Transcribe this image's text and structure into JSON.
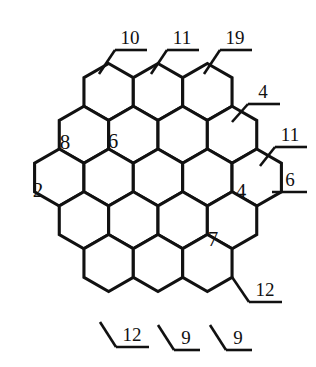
{
  "figure": {
    "type": "patent-line-drawing",
    "background_color": "#ffffff",
    "line_color": "#111111",
    "cell_rows": [
      3,
      4,
      5,
      4,
      3
    ],
    "cell_count_total": 19,
    "cell_shape": "hexagon-pointy-top"
  },
  "interior_labels": [
    {
      "text": "8",
      "x": 65,
      "y": 144
    },
    {
      "text": "6",
      "x": 113,
      "y": 143
    },
    {
      "text": "2",
      "x": 38,
      "y": 192
    },
    {
      "text": "4",
      "x": 241,
      "y": 193
    },
    {
      "text": "7",
      "x": 213,
      "y": 241
    }
  ],
  "callouts": [
    {
      "text": "10",
      "x": 130,
      "y": 40,
      "underline": {
        "x1": 115,
        "x2": 147,
        "y": 50
      },
      "leader": {
        "x1": 115,
        "y1": 50,
        "x2": 99,
        "y2": 74
      }
    },
    {
      "text": "11",
      "x": 182,
      "y": 40,
      "underline": {
        "x1": 167,
        "x2": 199,
        "y": 50
      },
      "leader": {
        "x1": 167,
        "y1": 50,
        "x2": 151,
        "y2": 74
      }
    },
    {
      "text": "19",
      "x": 235,
      "y": 40,
      "underline": {
        "x1": 220,
        "x2": 252,
        "y": 50
      },
      "leader": {
        "x1": 220,
        "y1": 50,
        "x2": 204,
        "y2": 74
      }
    },
    {
      "text": "4",
      "x": 263,
      "y": 94,
      "underline": {
        "x1": 248,
        "x2": 280,
        "y": 104
      },
      "leader": {
        "x1": 248,
        "y1": 104,
        "x2": 232,
        "y2": 122
      }
    },
    {
      "text": "11",
      "x": 290,
      "y": 137,
      "underline": {
        "x1": 275,
        "x2": 307,
        "y": 147
      },
      "leader": {
        "x1": 275,
        "y1": 147,
        "x2": 260,
        "y2": 166
      }
    },
    {
      "text": "6",
      "x": 290,
      "y": 182,
      "underline": {
        "x1": 272,
        "x2": 307,
        "y": 192
      },
      "leader": null
    },
    {
      "text": "12",
      "x": 265,
      "y": 292,
      "underline": {
        "x1": 249,
        "x2": 282,
        "y": 302
      },
      "leader": {
        "x1": 249,
        "y1": 302,
        "x2": 232,
        "y2": 277
      }
    },
    {
      "text": "9",
      "x": 238,
      "y": 340,
      "underline": {
        "x1": 226,
        "x2": 252,
        "y": 350
      },
      "leader": {
        "x1": 226,
        "y1": 350,
        "x2": 210,
        "y2": 325
      }
    },
    {
      "text": "9",
      "x": 186,
      "y": 340,
      "underline": {
        "x1": 174,
        "x2": 200,
        "y": 350
      },
      "leader": {
        "x1": 174,
        "y1": 350,
        "x2": 158,
        "y2": 325
      }
    },
    {
      "text": "12",
      "x": 132,
      "y": 337,
      "underline": {
        "x1": 116,
        "x2": 149,
        "y": 347
      },
      "leader": {
        "x1": 116,
        "y1": 347,
        "x2": 100,
        "y2": 322
      }
    }
  ],
  "hex_grid": {
    "radius": 28.5,
    "origin_x": 41,
    "origin_y": 92,
    "row_step_y": 49.5,
    "col_step_x": 49.5,
    "row_offsets": [
      49.5,
      24.75,
      0,
      24.75,
      49.5
    ],
    "rows_cols": [
      3,
      4,
      5,
      4,
      3
    ]
  }
}
